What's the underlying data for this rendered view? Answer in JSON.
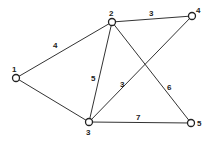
{
  "graph": {
    "nodes": [
      {
        "id": "1",
        "label": "1"
      },
      {
        "id": "2",
        "label": "2"
      },
      {
        "id": "3",
        "label": "3"
      },
      {
        "id": "4",
        "label": "4"
      },
      {
        "id": "5",
        "label": "5"
      }
    ],
    "edges": [
      {
        "from": "1",
        "to": "2",
        "weight": "4"
      },
      {
        "from": "1",
        "to": "3",
        "weight": ""
      },
      {
        "from": "2",
        "to": "4",
        "weight": "3"
      },
      {
        "from": "2",
        "to": "3",
        "weight": "5"
      },
      {
        "from": "3",
        "to": "4",
        "weight": "3"
      },
      {
        "from": "2",
        "to": "5",
        "weight": "6"
      },
      {
        "from": "3",
        "to": "5",
        "weight": "7"
      }
    ]
  }
}
